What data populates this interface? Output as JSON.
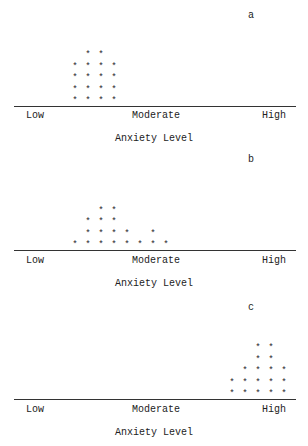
{
  "chart_data": [
    {
      "type": "bar",
      "subtype": "asterisk-frequency-plot",
      "panel": "a",
      "xlabel": "Anxiety Level",
      "tick_labels": [
        "Low",
        "Moderate",
        "High"
      ],
      "column_positions_px": [
        75,
        88,
        101,
        114
      ],
      "values": [
        4,
        5,
        5,
        4
      ],
      "total": 18,
      "grid": false
    },
    {
      "type": "bar",
      "subtype": "asterisk-frequency-plot",
      "panel": "b",
      "xlabel": "Anxiety Level",
      "tick_labels": [
        "Low",
        "Moderate",
        "High"
      ],
      "column_positions_px": [
        75,
        88,
        101,
        114,
        127,
        140,
        153,
        166
      ],
      "values": [
        1,
        3,
        4,
        4,
        2,
        1,
        2,
        1
      ],
      "total": 18,
      "grid": false
    },
    {
      "type": "bar",
      "subtype": "asterisk-frequency-plot",
      "panel": "c",
      "xlabel": "Anxiety Level",
      "tick_labels": [
        "Low",
        "Moderate",
        "High"
      ],
      "column_positions_px": [
        232,
        245,
        258,
        271,
        284
      ],
      "values": [
        2,
        3,
        5,
        5,
        3
      ],
      "total": 18,
      "grid": false
    }
  ],
  "panels": [
    {
      "letter": "a",
      "tick_low": "Low",
      "tick_mid": "Moderate",
      "tick_high": "High",
      "xlabel": "Anxiety Level"
    },
    {
      "letter": "b",
      "tick_low": "Low",
      "tick_mid": "Moderate",
      "tick_high": "High",
      "xlabel": "Anxiety Level"
    },
    {
      "letter": "c",
      "tick_low": "Low",
      "tick_mid": "Moderate",
      "tick_high": "High",
      "xlabel": "Anxiety Level"
    }
  ],
  "marker": "*"
}
